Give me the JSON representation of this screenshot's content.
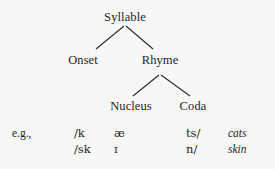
{
  "figure": {
    "background_color": "#f7f7f5",
    "text_color": "#1f1f1f",
    "line_color": "#2a2a2a"
  },
  "tree": {
    "root": {
      "label": "Syllable"
    },
    "level2": [
      {
        "label": "Onset"
      },
      {
        "label": "Rhyme"
      }
    ],
    "level3": [
      {
        "label": "Nucleus"
      },
      {
        "label": "Coda"
      }
    ]
  },
  "examples": {
    "lead_label": "e.g.,",
    "rows": [
      {
        "onset": "/k",
        "nucleus": "æ",
        "coda": "ts/",
        "word": "cats"
      },
      {
        "onset": "/sk",
        "nucleus": "ɪ",
        "coda": "n/",
        "word": "skin"
      }
    ]
  }
}
